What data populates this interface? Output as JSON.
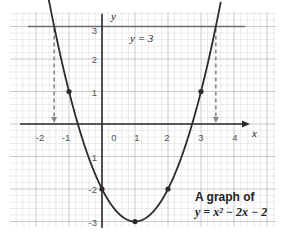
{
  "chart_data": {
    "type": "line",
    "title": "A graph of y = x² − 2x − 2",
    "caption_line1": "A graph of",
    "caption_line2": "y = x² − 2x − 2",
    "xlabel": "x",
    "ylabel": "y",
    "xlim": [
      -2.8,
      5.2
    ],
    "ylim": [
      -3.2,
      3.5
    ],
    "grid": true,
    "x_ticks": [
      -2,
      -1,
      0,
      1,
      2,
      3,
      4
    ],
    "x_tick_labels": [
      "-2",
      "-1",
      "0",
      "1",
      "2",
      "3",
      "4"
    ],
    "y_ticks": [
      3,
      2,
      1,
      -1,
      -2,
      -3
    ],
    "y_tick_labels": [
      "3",
      "2",
      "1",
      "1",
      "-2",
      "-3"
    ],
    "series": [
      {
        "name": "y = x² − 2x − 2",
        "function": "x^2 - 2x - 2",
        "marked_points": [
          {
            "x": -1,
            "y": 1
          },
          {
            "x": 0,
            "y": -2
          },
          {
            "x": 1,
            "y": -3
          },
          {
            "x": 2,
            "y": -2
          },
          {
            "x": 3,
            "y": 1
          }
        ]
      },
      {
        "name": "y = 3",
        "function": "3",
        "label": "y = 3"
      }
    ],
    "annotations": [
      {
        "type": "dashed-arrow",
        "x": -1.45,
        "from_y": 3,
        "to_y": 0
      },
      {
        "type": "dashed-arrow",
        "x": 3.45,
        "from_y": 3,
        "to_y": 0
      }
    ]
  },
  "colors": {
    "curve": "#2b2b2b",
    "axis": "#2b2b2b",
    "hline": "#6b6b6b",
    "dashed": "#8a8a8a",
    "grid_minor": "#d9d9d9",
    "grid_major": "#bdbdbd"
  }
}
